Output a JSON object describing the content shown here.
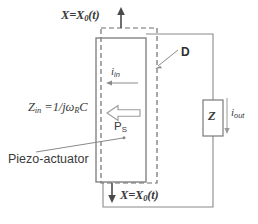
{
  "diagram": {
    "labels": {
      "displacement_top": "X=X",
      "displacement_top_sub": "0",
      "displacement_top_arg": "(t)",
      "displacement_bottom": "X=X",
      "displacement_bottom_sub": "0",
      "displacement_bottom_arg": "(t)",
      "input_impedance": "Z",
      "input_impedance_sub": "in",
      "input_impedance_expr": " =1/jω",
      "input_impedance_expr_sub": "R",
      "input_impedance_expr_tail": "C",
      "input_current": "i",
      "input_current_sub": "in",
      "output_current": "i",
      "output_current_sub": "out",
      "power_flow": "P",
      "power_flow_sub": "S",
      "dielectric_displacement": "D",
      "load_impedance": "Z",
      "actuator_name": "Piezo-actuator"
    },
    "icons": {
      "arrow_up": "arrow-up-icon",
      "arrow_down": "arrow-down-icon",
      "arrow_left_current": "arrow-left-icon",
      "arrow_left_block": "block-arrow-left-icon",
      "arrow_down_current": "arrow-down-icon",
      "leader_d": "leader-line-icon",
      "leader_piezo": "leader-line-icon"
    },
    "colors": {
      "stroke": "#6b6b6b",
      "stroke_dark": "#4a4a4a",
      "text": "#3a3a3a",
      "background": "#ffffff"
    }
  }
}
